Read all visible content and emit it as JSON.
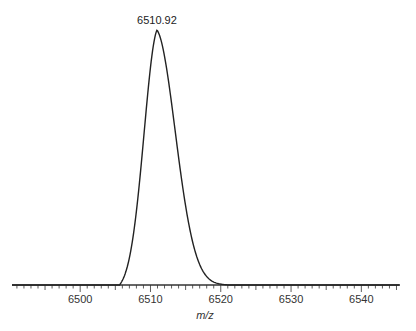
{
  "chart_data": {
    "type": "line",
    "title": "",
    "xlabel": "m/z",
    "ylabel": "",
    "xlim": [
      6490.3,
      6545.5
    ],
    "ylim": [
      0,
      1
    ],
    "grid": false,
    "legend": null,
    "x_ticks": [
      6500,
      6510,
      6520,
      6530,
      6540
    ],
    "x_tick_labels": [
      "6500",
      "6510",
      "6520",
      "6530",
      "6540"
    ],
    "minor_tick_step": 1,
    "annotations": [
      {
        "text": "6510.92",
        "x": 6510.92,
        "y": 1.0
      }
    ],
    "series": [
      {
        "name": "spectrum",
        "peak_center": 6510.92,
        "peak_start": 6505.0,
        "peak_end": 6521.0,
        "x": [
          6490.3,
          6505.0,
          6506.0,
          6507.0,
          6508.0,
          6509.0,
          6510.0,
          6510.92,
          6512.0,
          6513.0,
          6514.0,
          6515.0,
          6516.0,
          6517.0,
          6518.0,
          6519.0,
          6520.0,
          6521.0,
          6545.5
        ],
        "y": [
          0.0,
          0.0,
          0.08,
          0.3,
          0.58,
          0.84,
          0.98,
          1.0,
          0.93,
          0.74,
          0.52,
          0.32,
          0.17,
          0.08,
          0.035,
          0.012,
          0.003,
          0.0,
          0.0
        ]
      }
    ]
  }
}
